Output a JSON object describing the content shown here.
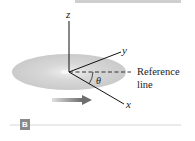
{
  "figure": {
    "panel_label": "B",
    "axes": {
      "z": "z",
      "y": "y",
      "x": "x"
    },
    "angle_label": "θ",
    "reference_label_line1": "Reference",
    "reference_label_line2": "line"
  },
  "colors": {
    "disk": "#d4d4d4",
    "arrow": "#7a7a7a",
    "rule": "#cfcfcf",
    "badge": "#8a8a8a"
  }
}
